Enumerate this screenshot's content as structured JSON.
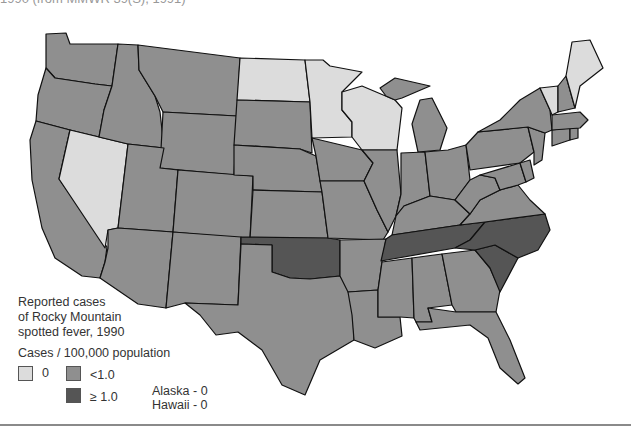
{
  "header": {
    "caption": "1990 (from MMWR 39(S), 1991)"
  },
  "map": {
    "title_lines": [
      "Reported cases",
      "of Rocky Mountain",
      "spotted fever, 1990"
    ],
    "colors": {
      "zero": "#dcdcdc",
      "low": "#8f8f8f",
      "high": "#555555",
      "border": "#111111"
    },
    "states_zero": [
      "Nevada",
      "North Dakota",
      "Minnesota",
      "Wisconsin",
      "Vermont",
      "Maine"
    ],
    "states_high": [
      "Oklahoma",
      "Tennessee",
      "North Carolina",
      "South Carolina"
    ],
    "states_low": "all other contiguous states"
  },
  "legend": {
    "title": "Cases / 100,000 population",
    "items": [
      {
        "label": "0",
        "color": "#dcdcdc"
      },
      {
        "label": "<1.0",
        "color": "#8f8f8f"
      },
      {
        "label": "≥ 1.0",
        "color": "#555555"
      }
    ],
    "notes": [
      "Alaska - 0",
      "Hawaii - 0"
    ]
  }
}
